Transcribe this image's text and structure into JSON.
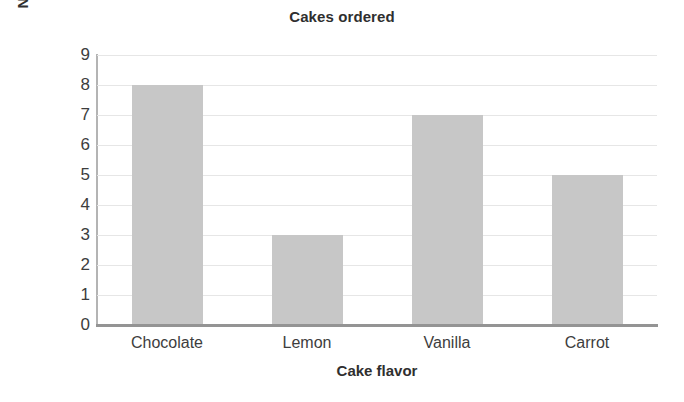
{
  "chart_data": {
    "type": "bar",
    "title": "Cakes ordered",
    "xlabel": "Cake flavor",
    "ylabel": "Number of cakes",
    "categories": [
      "Chocolate",
      "Lemon",
      "Vanilla",
      "Carrot"
    ],
    "values": [
      8,
      3,
      7,
      5
    ],
    "ylim": [
      0,
      9
    ],
    "ytick_labels": [
      "0",
      "1",
      "2",
      "3",
      "4",
      "5",
      "6",
      "7",
      "8",
      "9"
    ],
    "ytick_values": [
      0,
      1,
      2,
      3,
      4,
      5,
      6,
      7,
      8,
      9
    ],
    "grid": true,
    "grid_axis": "y",
    "legend": false,
    "legend_position": "none",
    "series": [
      {
        "name": "Number of cakes",
        "values": [
          8,
          3,
          7,
          5
        ]
      }
    ],
    "colors": {
      "bar_fill": "#c7c7c7",
      "gridline": "#e6e6e6",
      "axis_line": "#949494",
      "y_axis_line": "#b4b4b4",
      "text": "#3d3d3d",
      "title_text": "#2f2f2f",
      "background": "#ffffff"
    }
  }
}
